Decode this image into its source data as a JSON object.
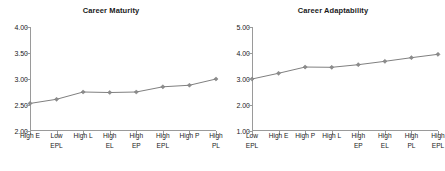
{
  "figure": {
    "background": "#ffffff",
    "series_color": "#808080",
    "axis_color": "#9a9a9a",
    "text_color": "#1a1a1a"
  },
  "chart_data": [
    {
      "type": "line",
      "title": "Career Maturity",
      "xlabel": "",
      "ylabel": "",
      "ylim": [
        2.0,
        4.0
      ],
      "ytick_step": 0.5,
      "ytick_labels": [
        "2.00",
        "2.50",
        "3.00",
        "3.50",
        "4.00"
      ],
      "ytick_values": [
        2.0,
        2.5,
        3.0,
        3.5,
        4.0
      ],
      "grid": false,
      "legend": "none",
      "marker": "diamond",
      "categories": [
        "High E",
        "Low EPL",
        "High L",
        "High EL",
        "High EP",
        "High EPL",
        "High P",
        "High PL"
      ],
      "category_lines": [
        [
          "High E"
        ],
        [
          "Low",
          "EPL"
        ],
        [
          "High L"
        ],
        [
          "High",
          "EL"
        ],
        [
          "High",
          "EP"
        ],
        [
          "High",
          "EPL"
        ],
        [
          "High P"
        ],
        [
          "High",
          "PL"
        ]
      ],
      "values": [
        2.53,
        2.61,
        2.75,
        2.74,
        2.75,
        2.85,
        2.88,
        3.0
      ]
    },
    {
      "type": "line",
      "title": "Career Adaptability",
      "xlabel": "",
      "ylabel": "",
      "ylim": [
        1.0,
        5.0
      ],
      "ytick_step": 1.0,
      "ytick_labels": [
        "1.00",
        "2.00",
        "3.00",
        "4.00",
        "5.00"
      ],
      "ytick_values": [
        1.0,
        2.0,
        3.0,
        4.0,
        5.0
      ],
      "grid": false,
      "legend": "none",
      "marker": "diamond",
      "categories": [
        "Low EPL",
        "High E",
        "High P",
        "High L",
        "High EP",
        "High EL",
        "High PL",
        "High EPL"
      ],
      "category_lines": [
        [
          "Low",
          "EPL"
        ],
        [
          "High E"
        ],
        [
          "High P"
        ],
        [
          "High L"
        ],
        [
          "High",
          "EP"
        ],
        [
          "High",
          "EL"
        ],
        [
          "High",
          "PL"
        ],
        [
          "High",
          "EPL"
        ]
      ],
      "values": [
        3.0,
        3.22,
        3.46,
        3.45,
        3.55,
        3.68,
        3.82,
        3.95
      ]
    }
  ]
}
